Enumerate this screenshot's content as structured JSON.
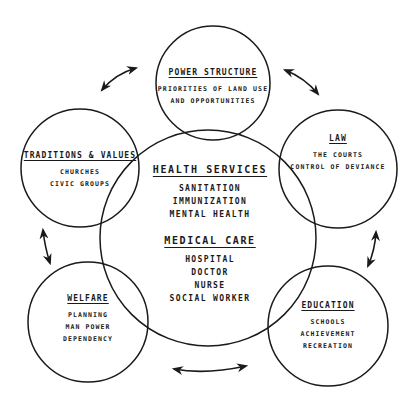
{
  "diagram": {
    "center": {
      "sections": [
        {
          "title": "HEALTH SERVICES",
          "items": [
            "SANITATION",
            "IMMUNIZATION",
            "MENTAL HEALTH"
          ]
        },
        {
          "title": "MEDICAL CARE",
          "items": [
            "HOSPITAL",
            "DOCTOR",
            "NURSE",
            "SOCIAL WORKER"
          ]
        }
      ]
    },
    "satellites": [
      {
        "id": "power",
        "title": "POWER STRUCTURE",
        "items": [
          "PRIORITIES OF LAND USE",
          "AND OPPORTUNITIES"
        ]
      },
      {
        "id": "traditions",
        "title": "TRADITIONS & VALUES",
        "items": [
          "CHURCHES",
          "CIVIC GROUPS"
        ]
      },
      {
        "id": "law",
        "title": "LAW",
        "items": [
          "THE COURTS",
          "CONTROL OF DEVIANCE"
        ]
      },
      {
        "id": "welfare",
        "title": "WELFARE",
        "items": [
          "PLANNING",
          "MAN POWER",
          "DEPENDENCY"
        ]
      },
      {
        "id": "education",
        "title": "EDUCATION",
        "items": [
          "SCHOOLS",
          "ACHIEVEMENT",
          "RECREATION"
        ]
      }
    ],
    "arrows": [
      {
        "from": "traditions",
        "to": "power",
        "type": "bidirectional"
      },
      {
        "from": "power",
        "to": "law",
        "type": "bidirectional"
      },
      {
        "from": "law",
        "to": "education",
        "type": "bidirectional"
      },
      {
        "from": "education",
        "to": "welfare",
        "type": "bidirectional"
      },
      {
        "from": "welfare",
        "to": "traditions",
        "type": "bidirectional"
      }
    ],
    "colors": {
      "line": "#1a1a1a",
      "background": "#ffffff"
    }
  }
}
